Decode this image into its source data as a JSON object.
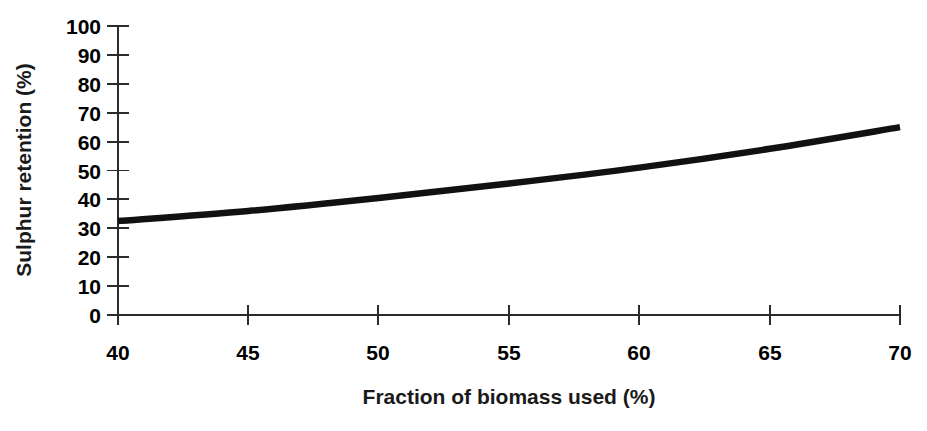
{
  "chart_data": {
    "type": "line",
    "title": "",
    "subtitle": "",
    "xlabel": "Fraction of biomass used (%)",
    "ylabel": "Sulphur retention (%)",
    "xlim": [
      40,
      70
    ],
    "ylim": [
      0,
      100
    ],
    "xticks": [
      40,
      45,
      50,
      55,
      60,
      65,
      70
    ],
    "yticks": [
      0,
      10,
      20,
      30,
      40,
      50,
      60,
      70,
      80,
      90,
      100
    ],
    "xtick_labels": [
      "40",
      "45",
      "50",
      "55",
      "60",
      "65",
      "70"
    ],
    "ytick_labels": [
      "0",
      "10",
      "20",
      "30",
      "40",
      "50",
      "60",
      "70",
      "80",
      "90",
      "100"
    ],
    "grid": false,
    "legend": false,
    "legend_position": "none",
    "series": [
      {
        "name": "Sulphur retention",
        "color": "#111111",
        "line_width": 6.5,
        "x": [
          40,
          45,
          50,
          55,
          60,
          65,
          70
        ],
        "values": [
          32.5,
          36.0,
          40.5,
          45.5,
          51.0,
          57.5,
          65.0
        ]
      }
    ]
  },
  "axes": {
    "y_title": "Sulphur retention (%)",
    "x_title": "Fraction of biomass used (%)",
    "y_labels": [
      "100",
      "90",
      "80",
      "70",
      "60",
      "50",
      "40",
      "30",
      "20",
      "10",
      "0"
    ],
    "x_labels": [
      "40",
      "45",
      "50",
      "55",
      "60",
      "65",
      "70"
    ]
  },
  "colors": {
    "background": "#ffffff",
    "axis": "#2b2b2b",
    "curve": "#111111",
    "text": "#000000"
  }
}
